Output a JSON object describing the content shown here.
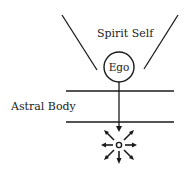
{
  "diagram": {
    "labels": {
      "spirit_self": "Spirit Self",
      "ego": "Ego",
      "astral_body": "Astral Body"
    },
    "colors": {
      "stroke": "#1a1a1a",
      "text": "#222222",
      "background": "#ffffff"
    }
  }
}
